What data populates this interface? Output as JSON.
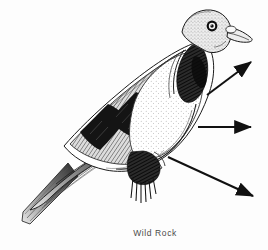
{
  "figure": {
    "caption": "Wild Rock",
    "medium": "black ink pen-and-stipple drawing",
    "background_color": "#fdfdfd",
    "ink_color": "#1a1a1a",
    "width": 268,
    "height": 250
  },
  "bird": {
    "common_name": "Wild Rock",
    "orientation": "facing right, perched",
    "parts": [
      {
        "name": "head",
        "shade": "light grey stipple"
      },
      {
        "name": "eye",
        "shade": "dark ring with pale iris"
      },
      {
        "name": "beak",
        "shade": "dark outline with pale cere"
      },
      {
        "name": "neck-patch",
        "shade": "dark iridescent hatching"
      },
      {
        "name": "breast",
        "shade": "pale with fine stipple"
      },
      {
        "name": "wing-coverts",
        "shade": "mid grey"
      },
      {
        "name": "wing-bar-upper",
        "shade": "solid black bar"
      },
      {
        "name": "wing-bar-lower",
        "shade": "solid black bar"
      },
      {
        "name": "primaries",
        "shade": "long dark streaked feathers"
      },
      {
        "name": "tail",
        "shade": "dark with pale tip"
      },
      {
        "name": "legs",
        "shade": "dark vertical hatching"
      }
    ]
  },
  "annotations": {
    "arrow_color": "#111111",
    "arrows": [
      {
        "name": "arrow-upper",
        "direction": "up-right",
        "x1": 207,
        "y1": 95,
        "x2": 251,
        "y2": 62
      },
      {
        "name": "arrow-middle",
        "direction": "right",
        "x1": 198,
        "y1": 127,
        "x2": 251,
        "y2": 127
      },
      {
        "name": "arrow-lower",
        "direction": "down-right",
        "x1": 168,
        "y1": 157,
        "x2": 253,
        "y2": 196
      }
    ]
  }
}
